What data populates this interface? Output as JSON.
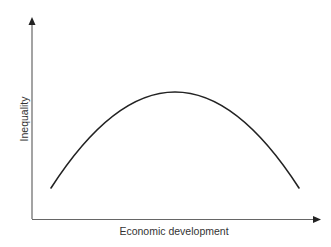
{
  "diagram": {
    "type": "curve",
    "title": "",
    "x_axis": {
      "label": "Economic development"
    },
    "y_axis": {
      "label": "Inequality"
    },
    "curve": {
      "shape": "inverted-U",
      "description": "Inequality rises then falls with economic development",
      "points": [
        {
          "x": 51,
          "y": 188
        },
        {
          "x": 100,
          "y": 125
        },
        {
          "x": 175,
          "y": 92
        },
        {
          "x": 250,
          "y": 125
        },
        {
          "x": 299,
          "y": 188
        }
      ]
    },
    "colors": {
      "line": "#222222",
      "axis": "#555555",
      "text": "#333333",
      "background": "#ffffff"
    }
  }
}
